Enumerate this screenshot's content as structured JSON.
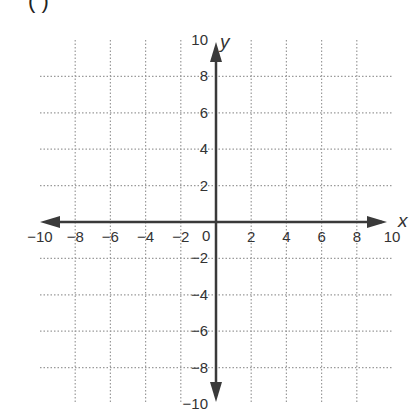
{
  "figure": {
    "partial_label": "(  )",
    "x_axis_label": "x",
    "y_axis_label": "y",
    "origin_label": "0",
    "x_range": [
      -10,
      10
    ],
    "y_range": [
      -10,
      10
    ],
    "grid_step": 2,
    "grid_style": "dotted",
    "x_tick_labels": [
      "−10",
      "−8",
      "−6",
      "−4",
      "−2",
      "2",
      "4",
      "6",
      "8",
      "10"
    ],
    "x_tick_values": [
      -10,
      -8,
      -6,
      -4,
      -2,
      2,
      4,
      6,
      8,
      10
    ],
    "y_tick_labels": [
      "10",
      "8",
      "6",
      "4",
      "2",
      "−2",
      "−4",
      "−6",
      "−8",
      "−10"
    ],
    "y_tick_values": [
      10,
      8,
      6,
      4,
      2,
      -2,
      -4,
      -6,
      -8,
      -10
    ],
    "colors": {
      "axis": "#3a3a3a",
      "grid": "#9a9a9a",
      "text": "#333333"
    }
  }
}
